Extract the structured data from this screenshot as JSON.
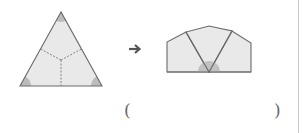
{
  "figure": {
    "arrow": "→",
    "colors": {
      "fill": "#e9e9e9",
      "stroke": "#6a6a6a",
      "angle_shade": "#bcbcbc",
      "dashed": "#777777"
    }
  },
  "answer_blank": {
    "open_paren": "(",
    "close_paren": ")"
  }
}
